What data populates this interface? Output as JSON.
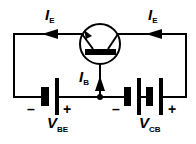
{
  "diagram": {
    "title": "",
    "type": "circuit",
    "labels": {
      "ie_left": {
        "main": "I",
        "sub": "E"
      },
      "ie_right": {
        "main": "I",
        "sub": "E"
      },
      "ib": {
        "main": "I",
        "sub": "B"
      },
      "vbe": {
        "main": "V",
        "sub": "BE"
      },
      "vcb": {
        "main": "V",
        "sub": "CB"
      }
    },
    "polarity": {
      "vbe_neg": "–",
      "vbe_pos": "+",
      "vcb_neg": "–",
      "vcb_pos": "+"
    },
    "components": [
      "bipolar-transistor",
      "battery-vbe",
      "battery-vcb"
    ],
    "colors": {
      "line": "#000000",
      "background": "#ffffff"
    }
  }
}
